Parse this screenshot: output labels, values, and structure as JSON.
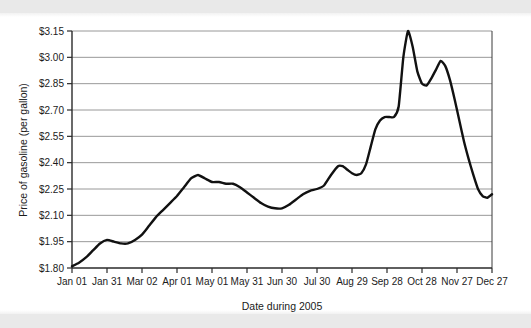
{
  "figure": {
    "background_color": "#ffffff",
    "scan_band_color": "#e9e9e9"
  },
  "chart_data": {
    "type": "line",
    "title": "",
    "xlabel": "Date during 2005",
    "ylabel": "Price of gasoline (per gallon)",
    "grid": true,
    "legend": "none",
    "line_color": "#111111",
    "grid_color": "#8d8d8d",
    "ylim": [
      1.8,
      3.15
    ],
    "ytick_labels": [
      "$3.15",
      "$3.00",
      "$2.85",
      "$2.70",
      "$2.55",
      "$2.40",
      "$2.25",
      "$2.10",
      "$1.95",
      "$1.80"
    ],
    "ytick_values": [
      3.15,
      3.0,
      2.85,
      2.7,
      2.55,
      2.4,
      2.25,
      2.1,
      1.95,
      1.8
    ],
    "categories": [
      "Jan 01",
      "Jan 31",
      "Mar 02",
      "Apr 01",
      "May 01",
      "May 31",
      "Jun 30",
      "Jul 30",
      "Aug 29",
      "Sep 28",
      "Oct 28",
      "Nov 27",
      "Dec 27"
    ],
    "xtick_day_index": [
      0,
      30,
      60,
      90,
      120,
      150,
      180,
      210,
      240,
      270,
      300,
      330,
      360
    ],
    "xlim_day_index": [
      0,
      360
    ],
    "series": [
      {
        "name": "Price of gasoline (per gallon)",
        "x": [
          0,
          7,
          14,
          21,
          28,
          30,
          37,
          44,
          51,
          58,
          60,
          67,
          74,
          81,
          88,
          90,
          97,
          104,
          111,
          118,
          120,
          127,
          134,
          141,
          148,
          150,
          157,
          164,
          171,
          178,
          180,
          187,
          194,
          201,
          208,
          210,
          217,
          224,
          231,
          236,
          240,
          244,
          247,
          251,
          255,
          259,
          263,
          267,
          270,
          277,
          284,
          291,
          298,
          300,
          307,
          314,
          321,
          328,
          330,
          337,
          344,
          351,
          358,
          360
        ],
        "values": [
          1.81,
          1.83,
          1.86,
          1.9,
          1.95,
          1.96,
          1.95,
          1.94,
          1.94,
          1.97,
          1.99,
          2.05,
          2.1,
          2.14,
          2.19,
          2.21,
          2.27,
          2.32,
          2.33,
          2.3,
          2.29,
          2.29,
          2.28,
          2.28,
          2.25,
          2.24,
          2.21,
          2.17,
          2.15,
          2.14,
          2.14,
          2.15,
          2.18,
          2.21,
          2.24,
          2.25,
          2.26,
          2.31,
          2.37,
          2.38,
          2.37,
          2.34,
          2.33,
          2.33,
          2.36,
          2.45,
          2.57,
          2.64,
          2.66,
          2.66,
          2.67,
          3.01,
          3.15,
          3.13,
          2.98,
          2.86,
          2.84,
          2.88,
          2.91,
          2.98,
          2.93,
          2.82,
          2.7,
          2.66
        ],
        "annotations": [
          {
            "label": "start",
            "x": 0,
            "value": 1.81
          },
          {
            "label": "early-bump",
            "x": 30,
            "value": 1.96
          },
          {
            "label": "spring-peak",
            "x": 111,
            "value": 2.33
          },
          {
            "label": "summer-trough",
            "x": 178,
            "value": 2.14
          },
          {
            "label": "late-july-shoulder",
            "x": 236,
            "value": 2.38
          },
          {
            "label": "pre-spike-plateau",
            "x": 284,
            "value": 2.67
          },
          {
            "label": "maximum",
            "x": 298,
            "value": 3.15
          },
          {
            "label": "post-spike-dip",
            "x": 321,
            "value": 2.84
          },
          {
            "label": "secondary-peak",
            "x": 344,
            "value": 2.98
          },
          {
            "label": "autumn-trough",
            "x": 420,
            "value": 2.2
          },
          {
            "label": "end",
            "x": 450,
            "value": 2.25
          }
        ]
      }
    ],
    "series_full": {
      "name": "Price of gasoline (per gallon)",
      "x_days": [
        0,
        6,
        12,
        18,
        24,
        30,
        36,
        42,
        48,
        54,
        60,
        66,
        72,
        78,
        84,
        90,
        96,
        102,
        108,
        114,
        120,
        126,
        132,
        138,
        144,
        150,
        156,
        162,
        168,
        174,
        180,
        186,
        192,
        198,
        204,
        210,
        216,
        222,
        228,
        232,
        236,
        240,
        244,
        248,
        252,
        256,
        260,
        264,
        268,
        272,
        276,
        280,
        284,
        288,
        292,
        296,
        300,
        304,
        308,
        312,
        316,
        320,
        324,
        328,
        332,
        336,
        340,
        344,
        348,
        352,
        356,
        360
      ],
      "y_values": [
        1.81,
        1.83,
        1.86,
        1.9,
        1.94,
        1.96,
        1.95,
        1.94,
        1.94,
        1.96,
        1.99,
        2.04,
        2.09,
        2.13,
        2.17,
        2.21,
        2.26,
        2.31,
        2.33,
        2.31,
        2.29,
        2.29,
        2.28,
        2.28,
        2.26,
        2.23,
        2.2,
        2.17,
        2.15,
        2.14,
        2.14,
        2.16,
        2.19,
        2.22,
        2.24,
        2.25,
        2.27,
        2.33,
        2.38,
        2.38,
        2.36,
        2.34,
        2.33,
        2.34,
        2.39,
        2.49,
        2.59,
        2.64,
        2.66,
        2.66,
        2.66,
        2.72,
        3.0,
        3.15,
        3.06,
        2.92,
        2.85,
        2.84,
        2.88,
        2.93,
        2.98,
        2.95,
        2.87,
        2.76,
        2.64,
        2.52,
        2.42,
        2.33,
        2.25,
        2.21,
        2.2,
        2.22
      ]
    }
  }
}
